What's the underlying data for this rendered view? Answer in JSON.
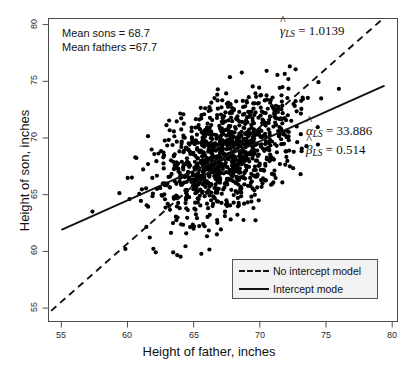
{
  "chart_data": {
    "type": "scatter",
    "title": "",
    "xlabel": "Height of father, inches",
    "ylabel": "Height of son, inches",
    "xlim": [
      54,
      81
    ],
    "ylim": [
      54,
      81
    ],
    "xticks": [
      55,
      60,
      65,
      70,
      75,
      80
    ],
    "yticks": [
      55,
      60,
      65,
      70,
      75,
      80
    ],
    "grid": false,
    "marker": "filled-circle",
    "marker_color": "#000000",
    "n_points": 1078,
    "annotations": {
      "mean_sons": "Mean sons = 68.7",
      "mean_fathers": "Mean fathers =67.7",
      "gamma_label": "γ",
      "gamma_sub": "LS",
      "gamma_eq": "= 1.0139",
      "gamma_value": 1.0139,
      "alpha_label": "α",
      "alpha_sub": "LS",
      "alpha_eq": "= 33.886",
      "alpha_value": 33.886,
      "beta_label": "β",
      "beta_sub": "LS",
      "beta_eq": "= 0.514",
      "beta_value": 0.514
    },
    "series": [
      {
        "name": "No intercept model",
        "type": "line",
        "style": "dashed",
        "color": "#111111",
        "slope": 1.0139,
        "intercept": 0,
        "x": [
          54.2,
          80.6
        ],
        "y": [
          54.95,
          81.72
        ]
      },
      {
        "name": "Intercept mode",
        "type": "line",
        "style": "solid",
        "color": "#111111",
        "slope": 0.514,
        "intercept": 33.886,
        "x": [
          55.0,
          80.0
        ],
        "y": [
          62.16,
          75.01
        ]
      }
    ],
    "legend": {
      "position": "bottom-right",
      "entries": [
        {
          "label": "No intercept model",
          "style": "dashed"
        },
        {
          "label": "Intercept mode",
          "style": "solid"
        }
      ]
    },
    "scatter_summary": {
      "x_mean": 67.7,
      "y_mean": 68.7,
      "x_sd": 2.74,
      "y_sd": 2.81,
      "correlation": 0.501,
      "x_range": [
        58.5,
        75.4
      ],
      "y_range": [
        58.5,
        78.4
      ]
    }
  },
  "axes": {
    "x": {
      "label": "Height of father, inches",
      "ticks": [
        "55",
        "60",
        "65",
        "70",
        "75",
        "80"
      ]
    },
    "y": {
      "label": "Height of son, inches",
      "ticks": [
        "55",
        "60",
        "65",
        "70",
        "75",
        "80"
      ]
    }
  },
  "legend": {
    "items": [
      {
        "label": "No intercept model"
      },
      {
        "label": "Intercept mode"
      }
    ]
  },
  "notes": {
    "mean_sons": "Mean sons = 68.7",
    "mean_fathers": "Mean fathers =67.7"
  },
  "colors": {
    "background": "#ffffff",
    "axis": "#4d4d4d",
    "point": "#000000",
    "line": "#111111",
    "legend_bg": "#f2f2f2",
    "legend_border": "#555555"
  }
}
